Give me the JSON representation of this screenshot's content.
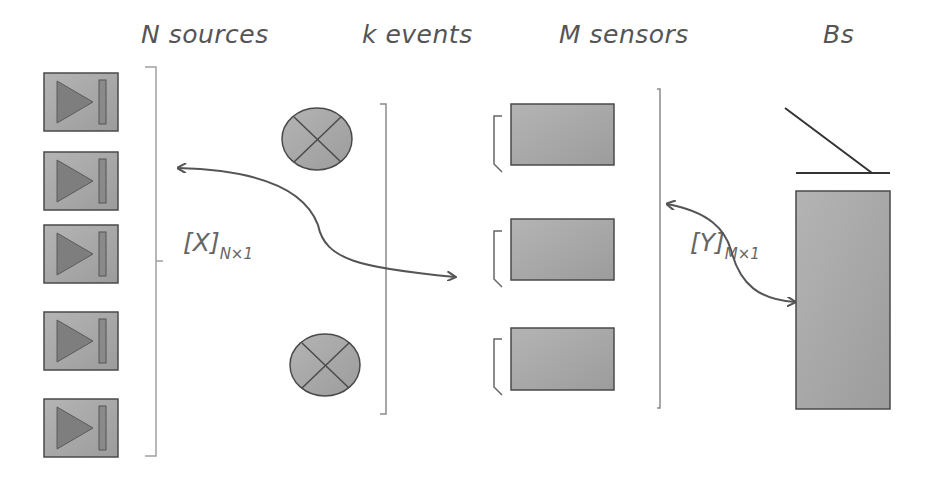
{
  "headers": {
    "sources": "N sources",
    "events": "k events",
    "sensors": "M sensors",
    "bs": "Bs"
  },
  "vectors": {
    "x_label": "[X]",
    "x_sub": "N×1",
    "y_label": "[Y]",
    "y_sub": "M×1"
  },
  "elements": {
    "sources": {
      "count": 5,
      "icon": "play-next-icon"
    },
    "events": {
      "count": 2,
      "icon": "cross-circle-icon"
    },
    "sensors": {
      "count": 3,
      "icon": "sensor-rect"
    },
    "base_station": {
      "count": 1,
      "icon": "base-station-antenna"
    }
  },
  "colors": {
    "fill": "#a8a8a8",
    "stroke": "#4a4a4a",
    "text": "#555555",
    "bracket": "#9a9a9a"
  }
}
